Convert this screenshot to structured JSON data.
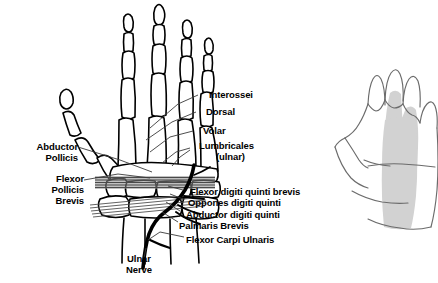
{
  "figure": {
    "background_color": "#ffffff",
    "ink_color": "#000000",
    "nerve_color": "#000000",
    "muscle_hatch_color": "#555555",
    "leader_line_color": "#3a3a3a",
    "shaded_region_color": "#d2d2d2",
    "outline_hand_color": "#6b6b6b"
  },
  "labels": {
    "interossei": "Interossei",
    "dorsal": "Dorsal",
    "volar": "Volar",
    "lumbricales_line1": "Lumbricales",
    "lumbricales_line2": "(ulnar)",
    "abductor_pollicis_line1": "Abductor",
    "abductor_pollicis_line2": "Pollicis",
    "flexor_pollicis_brevis_line1": "Flexor",
    "flexor_pollicis_brevis_line2": "Pollicis",
    "flexor_pollicis_brevis_line3": "Brevis",
    "flexor_digiti_quinti_brevis": "Flexor digiti quinti brevis",
    "oppones_digiti_quinti": "Oppones digiti quinti",
    "abductor_digiti_quinti": "Abductor digiti quinti",
    "palmaris_brevis": "Palmaris Brevis",
    "flexor_carpi_ulnaris": "Flexor Carpi Ulnaris",
    "ulnar_nerve_line1": "Ulnar",
    "ulnar_nerve_line2": "Nerve"
  }
}
